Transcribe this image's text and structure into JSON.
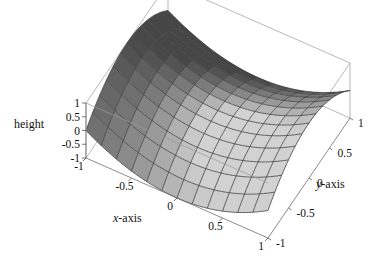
{
  "figure": {
    "kind": "3d-surface-plot",
    "width": 379,
    "height": 262,
    "background": "#ffffff"
  },
  "labels": {
    "z_title": "height",
    "x_title_italic": "x",
    "x_title_rest": "-axis",
    "y_title_italic": "y",
    "y_title_rest": "-axis"
  },
  "chart_data": {
    "type": "surface",
    "title": "",
    "xlabel": "x-axis",
    "ylabel": "y-axis",
    "zlabel": "height",
    "xlim": [
      -1,
      1
    ],
    "ylim": [
      -1,
      1
    ],
    "zlim": [
      -1,
      1
    ],
    "xticks": [
      -1,
      -0.5,
      0,
      0.5,
      1
    ],
    "xtick_labels": [
      "-1",
      "-0.5",
      "0",
      "0.5",
      "1"
    ],
    "yticks": [
      1,
      0.5,
      0,
      -0.5,
      -1
    ],
    "ytick_labels": [
      "1",
      "0.5",
      "0",
      "-0.5",
      "-1"
    ],
    "zticks": [
      1,
      0.5,
      0,
      -0.5,
      -1
    ],
    "ztick_labels": [
      "1",
      "0.5",
      "0",
      "-0.5",
      "-1"
    ],
    "grid": true,
    "legend": false,
    "mesh_n": 12,
    "surface_color_light": "#c2c2c2",
    "surface_color_dark": "#6e6e6e",
    "mesh_color": "#3a3a3a",
    "box_color": "#9a9a9a",
    "x": [
      -1,
      -0.8333,
      -0.6667,
      -0.5,
      -0.3333,
      -0.1667,
      0,
      0.1667,
      0.3333,
      0.5,
      0.6667,
      0.8333,
      1
    ],
    "y": [
      -1,
      -0.8333,
      -0.6667,
      -0.5,
      -0.3333,
      -0.1667,
      0,
      0.1667,
      0.3333,
      0.5,
      0.6667,
      0.8333,
      1
    ],
    "z_formula": "z = x*x - y*y",
    "z": [
      [
        0.0,
        -0.3889,
        -0.5556,
        -0.75,
        -0.8889,
        -0.9722,
        -1.0,
        -0.9722,
        -0.8889,
        -0.75,
        -0.5556,
        -0.3889,
        0.0
      ],
      [
        0.2778,
        -0.1111,
        -0.2778,
        -0.4722,
        -0.6111,
        -0.6944,
        -0.7222,
        -0.6944,
        -0.6111,
        -0.4722,
        -0.2778,
        -0.1111,
        0.2778
      ],
      [
        0.4444,
        0.0556,
        -0.1111,
        -0.3056,
        -0.4444,
        -0.5278,
        -0.5556,
        -0.5278,
        -0.4444,
        -0.3056,
        -0.1111,
        0.0556,
        0.4444
      ],
      [
        0.75,
        0.3611,
        0.1944,
        0.0,
        -0.1389,
        -0.2222,
        -0.25,
        -0.2222,
        -0.1389,
        0.0,
        0.1944,
        0.3611,
        0.75
      ],
      [
        0.8889,
        0.5,
        0.3333,
        0.1389,
        0.0,
        -0.0833,
        -0.1111,
        -0.0833,
        0.0,
        0.1389,
        0.3333,
        0.5,
        0.8889
      ],
      [
        0.9722,
        0.5833,
        0.4167,
        0.2222,
        0.0833,
        0.0,
        -0.0278,
        0.0,
        0.0833,
        0.2222,
        0.4167,
        0.5833,
        0.9722
      ],
      [
        1.0,
        0.6111,
        0.4444,
        0.25,
        0.1111,
        0.0278,
        0.0,
        0.0278,
        0.1111,
        0.25,
        0.4444,
        0.6111,
        1.0
      ],
      [
        0.9722,
        0.5833,
        0.4167,
        0.2222,
        0.0833,
        0.0,
        -0.0278,
        0.0,
        0.0833,
        0.2222,
        0.4167,
        0.5833,
        0.9722
      ],
      [
        0.8889,
        0.5,
        0.3333,
        0.1389,
        0.0,
        -0.0833,
        -0.1111,
        -0.0833,
        0.0,
        0.1389,
        0.3333,
        0.5,
        0.8889
      ],
      [
        0.75,
        0.3611,
        0.1944,
        0.0,
        -0.1389,
        -0.2222,
        -0.25,
        -0.2222,
        -0.1389,
        0.0,
        0.1944,
        0.3611,
        0.75
      ],
      [
        0.4444,
        0.0556,
        -0.1111,
        -0.3056,
        -0.4444,
        -0.5278,
        -0.5556,
        -0.5278,
        -0.4444,
        -0.3056,
        -0.1111,
        0.0556,
        0.4444
      ],
      [
        0.2778,
        -0.1111,
        -0.2778,
        -0.4722,
        -0.6111,
        -0.6944,
        -0.7222,
        -0.6944,
        -0.6111,
        -0.4722,
        -0.2778,
        -0.1111,
        0.2778
      ],
      [
        0.0,
        -0.3889,
        -0.5556,
        -0.75,
        -0.8889,
        -0.9722,
        -1.0,
        -0.9722,
        -0.8889,
        -0.75,
        -0.5556,
        -0.3889,
        0.0
      ]
    ]
  },
  "projection": {
    "note": "pixel anchors read off the rendered figure",
    "origin_left_x": 86,
    "z_top_y": 103,
    "z_bot_y": 158,
    "front_vertex": [
      268,
      238
    ],
    "right_vertex": [
      350,
      118
    ],
    "back_top_left": [
      185,
      12
    ],
    "back_top_right": [
      350,
      22
    ]
  }
}
